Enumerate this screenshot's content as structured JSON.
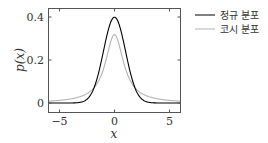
{
  "chart_data": {
    "type": "line",
    "title": "",
    "xlabel": "x",
    "ylabel": "p(x)",
    "xlim": [
      -6,
      6
    ],
    "ylim": [
      0,
      0.4
    ],
    "xticks": [
      -5,
      0,
      5
    ],
    "xtick_labels": [
      "−5",
      "0",
      "5"
    ],
    "yticks": [
      0,
      0.2,
      0.4
    ],
    "ytick_labels": [
      "0",
      "0.2",
      "0.4"
    ],
    "grid": false,
    "legend_position": "outside-right-top",
    "series": [
      {
        "name": "정규 분포",
        "color": "#000000",
        "function": "normal(0,1)",
        "x": [
          -6,
          -4,
          -3,
          -2,
          -1,
          -0.5,
          0,
          0.5,
          1,
          2,
          3,
          4,
          6
        ],
        "y": [
          0.0,
          0.0001,
          0.0044,
          0.054,
          0.242,
          0.352,
          0.399,
          0.352,
          0.242,
          0.054,
          0.0044,
          0.0001,
          0.0
        ]
      },
      {
        "name": "코시 분포",
        "color": "#b3b3b3",
        "function": "cauchy(0,1)",
        "x": [
          -6,
          -4,
          -3,
          -2,
          -1,
          -0.5,
          0,
          0.5,
          1,
          2,
          3,
          4,
          6
        ],
        "y": [
          0.0086,
          0.0187,
          0.0318,
          0.0637,
          0.159,
          0.255,
          0.318,
          0.255,
          0.159,
          0.0637,
          0.0318,
          0.0187,
          0.0086
        ]
      }
    ]
  },
  "legend": {
    "items": [
      {
        "label": "정규 분포",
        "color": "#000000"
      },
      {
        "label": "코시 분포",
        "color": "#b3b3b3"
      }
    ]
  }
}
